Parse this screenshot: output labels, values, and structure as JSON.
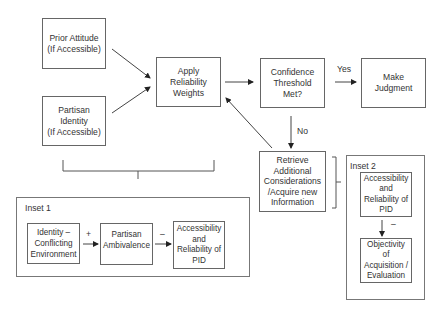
{
  "nodes": {
    "prior_attitude": "Prior Attitude\n(If Accessible)",
    "partisan_identity": "Partisan\nIdentity\n(If Accessible)",
    "apply_weights": "Apply\nReliability\nWeights",
    "confidence": "Confidence\nThreshold\nMet?",
    "make_judgment": "Make\nJudgment",
    "retrieve": "Retrieve\nAdditional\nConsiderations\n/Acquire new\nInformation"
  },
  "edge_labels": {
    "yes": "Yes",
    "no": "No"
  },
  "inset1": {
    "title": "Inset 1",
    "nodes": [
      "Identity –\nConflicting\nEnvironment",
      "Partisan\nAmbivalence",
      "Accessibility\nand\nReliability of\nPID"
    ],
    "signs": [
      "+",
      "–"
    ]
  },
  "inset2": {
    "title": "Inset 2",
    "nodes": [
      "Accessibility\nand\nReliability of\nPID",
      "Objectivity\nof\nAcquisition /\nEvaluation"
    ],
    "signs": [
      "–"
    ]
  }
}
